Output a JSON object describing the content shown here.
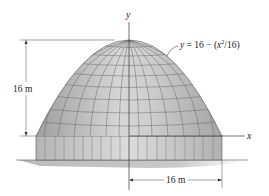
{
  "figure": {
    "type": "paraboloid dome with cylindrical base",
    "equation_label": "y = 16 − (x²/16)",
    "equation_parts": {
      "lhs": "y",
      "eq": " = 16 − (",
      "x": "x",
      "exp": "2",
      "rest": "/16)"
    },
    "axes": {
      "x_label": "x",
      "y_label": "y"
    },
    "dimensions": {
      "height": {
        "label": "16 m",
        "value": 16,
        "unit": "m"
      },
      "radius": {
        "label": "16 m",
        "value": 16,
        "unit": "m"
      }
    },
    "colors": {
      "dome_fill": "#b9b9b9",
      "dome_highlight": "#d8d8d8",
      "tile_lines": "#6a6a6a",
      "base_fill": "#cfcfcf",
      "ground_shadow": "#bdbdbd",
      "lines": "#333333"
    }
  }
}
